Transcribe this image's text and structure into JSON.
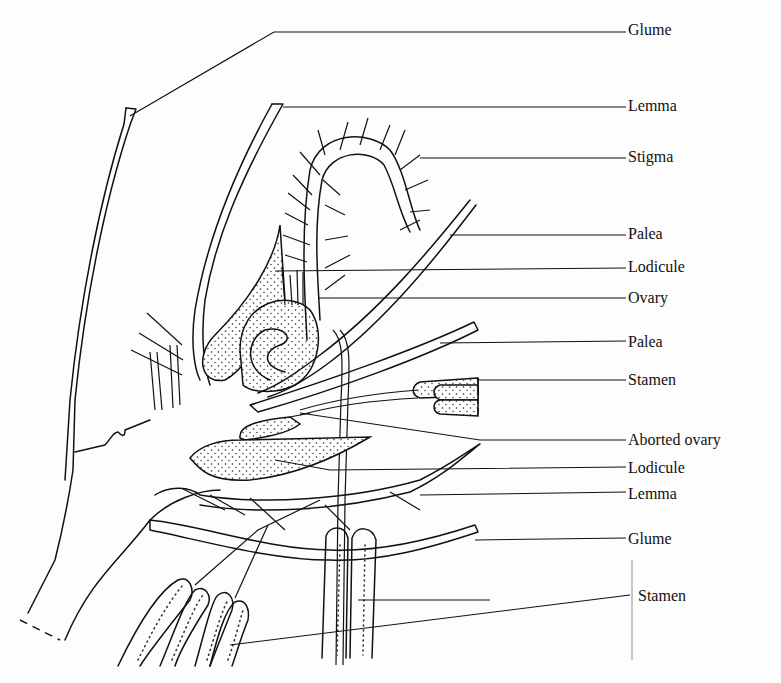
{
  "figure": {
    "labels": [
      {
        "id": "glume-top",
        "text": "Glume"
      },
      {
        "id": "lemma-top",
        "text": "Lemma"
      },
      {
        "id": "stigma",
        "text": "Stigma"
      },
      {
        "id": "palea-top",
        "text": "Palea"
      },
      {
        "id": "lodicule-top",
        "text": "Lodicule"
      },
      {
        "id": "ovary",
        "text": "Ovary"
      },
      {
        "id": "palea-lower",
        "text": "Palea"
      },
      {
        "id": "stamen-upper",
        "text": "Stamen"
      },
      {
        "id": "aborted-ovary",
        "text": "Aborted ovary"
      },
      {
        "id": "lodicule-lower",
        "text": "Lodicule"
      },
      {
        "id": "lemma-lower",
        "text": "Lemma"
      },
      {
        "id": "glume-lower",
        "text": "Glume"
      },
      {
        "id": "stamen-lower",
        "text": "Stamen"
      }
    ]
  }
}
